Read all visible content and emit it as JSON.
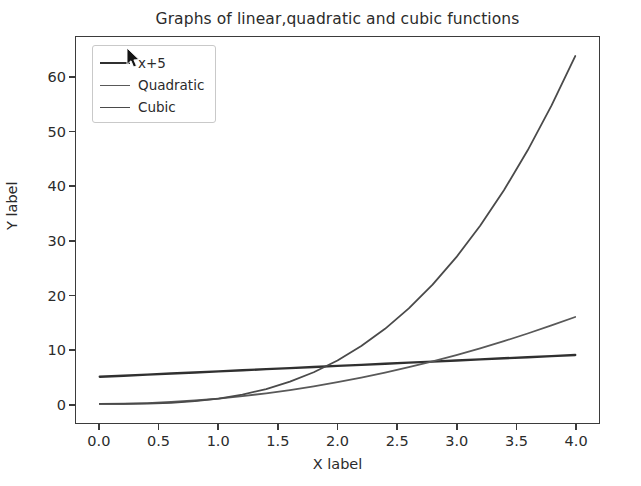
{
  "figure": {
    "background_color": "#ffffff",
    "axes_color": "#3b3b3b",
    "text_color": "#2b2b2b"
  },
  "cursor": {
    "icon": "mouse-pointer-icon",
    "x": 126,
    "y": 48,
    "color": "#1a1a1a"
  },
  "legend": {
    "entries": [
      {
        "label": "x+5",
        "color": "#303030",
        "width": 2.4
      },
      {
        "label": "Quadratic",
        "color": "#595959",
        "width": 1.8
      },
      {
        "label": "Cubic",
        "color": "#4a4a4a",
        "width": 1.8
      }
    ]
  },
  "chart_data": {
    "type": "line",
    "title": "Graphs of linear,quadratic and cubic functions",
    "xlabel": "X label",
    "ylabel": "Y label",
    "xlim": [
      -0.2,
      4.2
    ],
    "ylim": [
      -3.5,
      67.5
    ],
    "grid": false,
    "legend_position": "upper left",
    "xticks": [
      0.0,
      0.5,
      1.0,
      1.5,
      2.0,
      2.5,
      3.0,
      3.5,
      4.0
    ],
    "xtick_labels": [
      "0.0",
      "0.5",
      "1.0",
      "1.5",
      "2.0",
      "2.5",
      "3.0",
      "3.5",
      "4.0"
    ],
    "yticks": [
      0,
      10,
      20,
      30,
      40,
      50,
      60
    ],
    "ytick_labels": [
      "0",
      "10",
      "20",
      "30",
      "40",
      "50",
      "60"
    ],
    "x": [
      0.0,
      0.2,
      0.4,
      0.6,
      0.8,
      1.0,
      1.2,
      1.4,
      1.6,
      1.8,
      2.0,
      2.2,
      2.4,
      2.6,
      2.8,
      3.0,
      3.2,
      3.4,
      3.6,
      3.8,
      4.0
    ],
    "series": [
      {
        "name": "x+5",
        "color": "#303030",
        "linewidth": 2.4,
        "values": [
          5.0,
          5.2,
          5.4,
          5.6,
          5.8,
          6.0,
          6.2,
          6.4,
          6.6,
          6.8,
          7.0,
          7.2,
          7.4,
          7.6,
          7.8,
          8.0,
          8.2,
          8.4,
          8.6,
          8.8,
          9.0
        ]
      },
      {
        "name": "Quadratic",
        "color": "#595959",
        "linewidth": 1.8,
        "values": [
          0.0,
          0.04,
          0.16,
          0.36,
          0.64,
          1.0,
          1.44,
          1.96,
          2.56,
          3.24,
          4.0,
          4.84,
          5.76,
          6.76,
          7.84,
          9.0,
          10.24,
          11.56,
          12.96,
          14.44,
          16.0
        ]
      },
      {
        "name": "Cubic",
        "color": "#4a4a4a",
        "linewidth": 1.8,
        "values": [
          0.0,
          0.008,
          0.064,
          0.216,
          0.512,
          1.0,
          1.728,
          2.744,
          4.096,
          5.832,
          8.0,
          10.648,
          13.824,
          17.576,
          21.952,
          27.0,
          32.768,
          39.304,
          46.656,
          54.872,
          64.0
        ]
      }
    ]
  }
}
